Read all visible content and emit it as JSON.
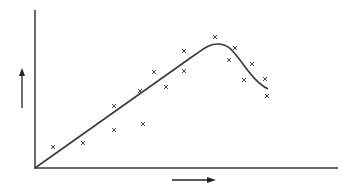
{
  "chart_data": {
    "type": "scatter",
    "title": "",
    "xlabel": "",
    "ylabel": "",
    "axis_arrows": {
      "x": "right",
      "y": "up"
    },
    "grid": false,
    "points": [
      [
        53,
        147
      ],
      [
        83,
        143
      ],
      [
        114,
        130
      ],
      [
        114,
        106
      ],
      [
        143,
        124
      ],
      [
        140,
        91
      ],
      [
        154,
        72
      ],
      [
        166,
        87
      ],
      [
        184,
        51
      ],
      [
        184,
        71
      ],
      [
        215,
        37
      ],
      [
        235,
        48
      ],
      [
        229,
        60
      ],
      [
        252,
        64
      ],
      [
        244,
        80
      ],
      [
        265,
        79
      ],
      [
        267,
        96
      ]
    ],
    "fit_curve": {
      "description": "linear rise from origin to peak, then decline",
      "path": [
        [
          35,
          168
        ],
        [
          200,
          50
        ],
        [
          215,
          45
        ],
        [
          230,
          50
        ],
        [
          268,
          89
        ]
      ]
    },
    "colors": {
      "axis": "#6a6a6a",
      "curve": "#3a3a3a",
      "marker": "#444444"
    }
  }
}
